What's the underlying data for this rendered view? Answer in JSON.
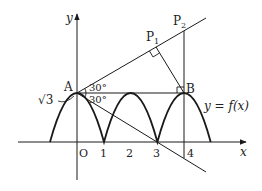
{
  "diagram": {
    "axes": {
      "x_label": "x",
      "y_label": "y",
      "origin_label": "O",
      "x_ticks": [
        "1",
        "2",
        "3",
        "4"
      ]
    },
    "points": {
      "A": "A",
      "B": "B",
      "P1": "P",
      "P1_sub": "1",
      "P2": "P",
      "P2_sub": "2"
    },
    "angles": {
      "upper": "30°",
      "lower": "30°"
    },
    "y_intercept_label": "√3",
    "curve_label": "y = f(x)",
    "colors": {
      "stroke": "#1a1a1a",
      "text": "#222222",
      "background": "#ffffff"
    }
  }
}
